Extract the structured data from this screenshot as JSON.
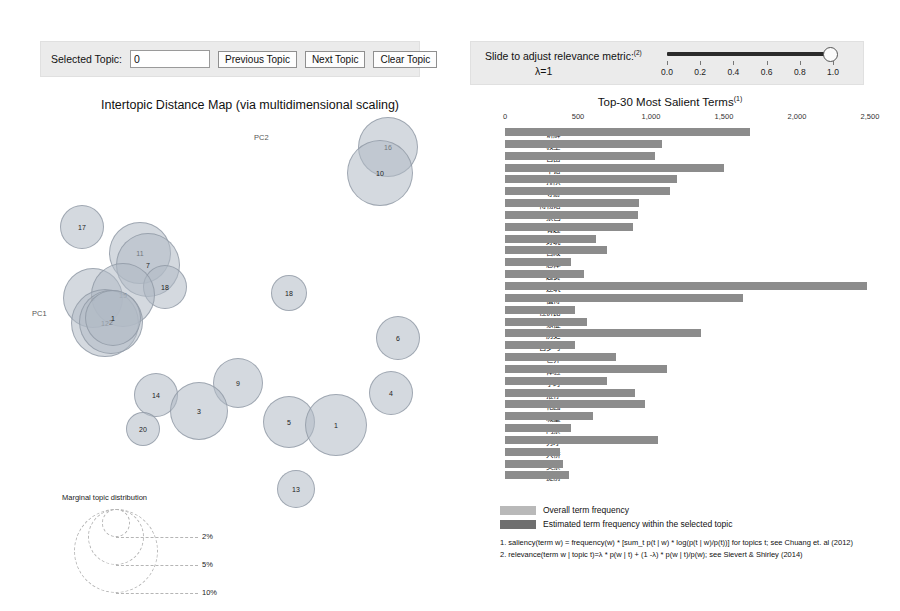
{
  "left_controls": {
    "selected_topic_label": "Selected Topic:",
    "selected_topic_value": "0",
    "previous_topic_label": "Previous Topic",
    "next_topic_label": "Next Topic",
    "clear_topic_label": "Clear Topic"
  },
  "right_controls": {
    "slider_caption": "Slide to adjust relevance metric:",
    "slider_caption_sup": "(2)",
    "lambda_label": "λ=1",
    "lambda_value": 1.0,
    "tick_labels": [
      "0.0",
      "0.2",
      "0.4",
      "0.6",
      "0.8",
      "1.0"
    ]
  },
  "map": {
    "title": "Intertopic Distance Map (via multidimensional scaling)",
    "axis_x_label": "PC1",
    "axis_y_label": "PC2",
    "legend_title": "Marginal topic distribution",
    "legend_sizes": [
      "2%",
      "5%",
      "10%"
    ],
    "bubble_fill": "#b0bac4",
    "bubble_stroke": "#8c96a2"
  },
  "chart_data": {
    "type": "bar",
    "title": "Top-30 Most Salient Terms",
    "title_sup": "(1)",
    "orientation": "horizontal",
    "xlabel": "",
    "ylabel": "",
    "xlim": [
      0,
      2500
    ],
    "xticks": [
      0,
      500,
      1000,
      1500,
      2000,
      2500
    ],
    "xtick_labels": [
      "0",
      "500",
      "1,000",
      "1,500",
      "2,000",
      "2,500"
    ],
    "grid": false,
    "legend_position": "bottom",
    "bar_color": "#8c8c8c",
    "categories": [
      "讲解",
      "教堂",
      "自由",
      "不错",
      "排队",
      "导游",
      "博物馆",
      "景色",
      "有趣",
      "好玩",
      "宫殿",
      "总体",
      "超赞",
      "建筑",
      "值得",
      "性价比",
      "象征",
      "历史",
      "古罗马",
      "世界",
      "体验",
      "小时",
      "推荐",
      "花园",
      "城堡",
      "门票",
      "秀才",
      "大桥",
      "买票",
      "提前"
    ],
    "values": [
      1680,
      1075,
      1030,
      1500,
      1180,
      1130,
      920,
      910,
      880,
      620,
      700,
      450,
      540,
      2480,
      1630,
      480,
      560,
      1340,
      480,
      760,
      1110,
      700,
      890,
      960,
      600,
      450,
      1050,
      380,
      400,
      440
    ],
    "series": [
      {
        "name": "Overall term frequency",
        "values": [
          1680,
          1075,
          1030,
          1500,
          1180,
          1130,
          920,
          910,
          880,
          620,
          700,
          450,
          540,
          2480,
          1630,
          480,
          560,
          1340,
          480,
          760,
          1110,
          700,
          890,
          960,
          600,
          450,
          1050,
          380,
          400,
          440
        ]
      }
    ],
    "legend": [
      {
        "label": "Overall term frequency",
        "color": "#b9b9b9"
      },
      {
        "label": "Estimated term frequency within the selected topic",
        "color": "#6f6f6f"
      }
    ]
  },
  "footnotes": [
    "1. saliency(term w) = frequency(w) * [sum_t p(t | w) * log(p(t | w)/p(t))] for topics t; see Chuang et. al (2012)",
    "2. relevance(term w | topic t)=λ * p(w | t) + (1 -λ) * p(w | t)/p(w); see Sievert & Shirley (2014)"
  ],
  "topics": [
    {
      "id": "16",
      "x": 348,
      "y": 32,
      "r": 30
    },
    {
      "id": "10",
      "x": 340,
      "y": 58,
      "r": 33
    },
    {
      "id": "17",
      "x": 42,
      "y": 112,
      "r": 22
    },
    {
      "id": "11",
      "x": 100,
      "y": 138,
      "r": 31
    },
    {
      "id": "7",
      "x": 108,
      "y": 150,
      "r": 32
    },
    {
      "id": "18",
      "x": 125,
      "y": 172,
      "r": 22
    },
    {
      "id": "8",
      "x": 53,
      "y": 183,
      "r": 30
    },
    {
      "id": "15",
      "x": 83,
      "y": 180,
      "r": 32
    },
    {
      "id": "12",
      "x": 65,
      "y": 208,
      "r": 34
    },
    {
      "id": "2",
      "x": 71,
      "y": 207,
      "r": 32
    },
    {
      "id": "1",
      "x": 73,
      "y": 203,
      "r": 28
    },
    {
      "id": "18b",
      "x": 249,
      "y": 178,
      "r": 18,
      "label": "18"
    },
    {
      "id": "6",
      "x": 358,
      "y": 223,
      "r": 22
    },
    {
      "id": "9",
      "x": 198,
      "y": 268,
      "r": 25
    },
    {
      "id": "4",
      "x": 351,
      "y": 278,
      "r": 22
    },
    {
      "id": "14",
      "x": 116,
      "y": 280,
      "r": 22
    },
    {
      "id": "3",
      "x": 159,
      "y": 296,
      "r": 29
    },
    {
      "id": "20",
      "x": 103,
      "y": 314,
      "r": 17
    },
    {
      "id": "5",
      "x": 249,
      "y": 307,
      "r": 26
    },
    {
      "id": "1b",
      "x": 296,
      "y": 310,
      "r": 31,
      "label": "1"
    },
    {
      "id": "13",
      "x": 256,
      "y": 374,
      "r": 19
    }
  ]
}
